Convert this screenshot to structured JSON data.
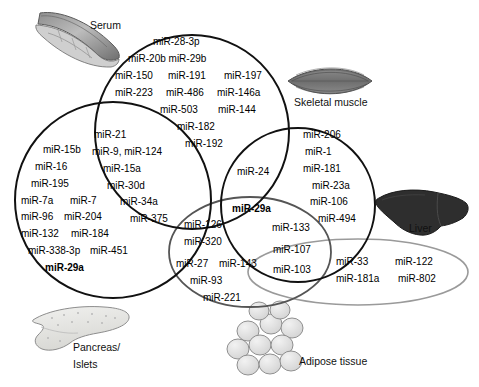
{
  "figure": {
    "type": "venn-diagram",
    "background": "#ffffff"
  },
  "sets": {
    "serum": {
      "name": "Serum",
      "shape": "circle",
      "stroke": "#111111",
      "cx": 192,
      "cy": 132,
      "r": 97
    },
    "pancreas": {
      "name": "Pancreas/ Islets",
      "shape": "circle",
      "stroke": "#111111",
      "cx": 113,
      "cy": 200,
      "r": 98
    },
    "skeletal_muscle": {
      "name": "Skeletal muscle",
      "shape": "circle",
      "stroke": "#111111",
      "cx": 298,
      "cy": 205,
      "r": 77
    },
    "adipose": {
      "name": "Adipose tissue",
      "shape": "ellipse",
      "stroke": "#555555",
      "cx": 250,
      "cy": 252,
      "rx": 81,
      "ry": 55
    },
    "liver": {
      "name": "Liver",
      "shape": "ellipse",
      "stroke": "#9a9a9a",
      "cx": 358,
      "cy": 272,
      "rx": 110,
      "ry": 33
    }
  },
  "tissue_labels": {
    "serum": "Serum",
    "skeletal_muscle": "Skeletal muscle",
    "liver": "Liver",
    "pancreas_line1": "Pancreas/",
    "pancreas_line2": "Islets",
    "adipose": "Adipose tissue"
  },
  "icons": {
    "serum": "blood-vessel-icon",
    "skeletal_muscle": "muscle-fiber-icon",
    "liver": "liver-organ-icon",
    "pancreas": "pancreas-organ-icon",
    "adipose": "adipocyte-cluster-icon"
  },
  "regions": {
    "serum_only": {
      "label": "Serum only",
      "entries": [
        "miR-28-3p",
        "miR-20b miR-29b",
        "miR-150   miR-191    miR-197",
        "miR-223  miR-486  miR-146a",
        "miR-503     miR-144",
        "miR-182",
        "miR-192"
      ]
    },
    "serum_pancreas": {
      "label": "Serum ∩ Pancreas/Islets",
      "entries": [
        "miR-21",
        "miR-9, miR-124",
        "miR-15a",
        "miR-30d",
        "miR-34a",
        "miR-375"
      ]
    },
    "pancreas_only": {
      "label": "Pancreas/Islets only",
      "entries": [
        "miR-15b",
        "miR-16",
        "miR-195",
        "miR-7a    miR-7",
        "miR-96  miR-204",
        "miR-132   miR-184",
        "miR-338-3p  miR-451",
        "miR-29a"
      ],
      "bold_entries": [
        "miR-29a"
      ]
    },
    "serum_skeletal": {
      "label": "Serum ∩ Skeletal muscle",
      "entries": [
        "miR-24"
      ]
    },
    "skeletal_only": {
      "label": "Skeletal muscle only",
      "entries": [
        "miR-206",
        "miR-1",
        "miR-181",
        "miR-23a",
        "miR-106",
        "miR-494"
      ]
    },
    "core_shared": {
      "label": "Serum ∩ Skeletal muscle ∩ Adipose",
      "entries": [
        "miR-29a"
      ],
      "bold_entries": [
        "miR-29a"
      ]
    },
    "serum_adipose": {
      "label": "Serum ∩ Adipose",
      "entries": [
        "miR-126",
        "miR-320"
      ]
    },
    "skeletal_adipose": {
      "label": "Skeletal muscle ∩ Adipose",
      "entries": [
        "miR-133"
      ]
    },
    "adipose_only": {
      "label": "Adipose tissue only",
      "entries": [
        "miR-27 miR-143",
        "miR-93",
        "miR-221"
      ]
    },
    "skeletal_adipose_liver": {
      "label": "Skeletal muscle ∩ Adipose ∩ Liver",
      "entries": [
        "miR-107"
      ]
    },
    "adipose_liver": {
      "label": "Adipose ∩ Liver",
      "entries": [
        "miR-103"
      ]
    },
    "liver_only": {
      "label": "Liver only",
      "entries": [
        "miR-33       miR-122",
        "miR-181a   miR-802"
      ]
    }
  },
  "text_items": [
    {
      "key": "t01",
      "text": "miR-28-3p",
      "x": 153,
      "y": 45,
      "bold": false,
      "region": "serum_only"
    },
    {
      "key": "t02",
      "text": "miR-20b miR-29b",
      "x": 128,
      "y": 62,
      "bold": false,
      "region": "serum_only"
    },
    {
      "key": "t03",
      "text": "miR-150",
      "x": 115,
      "y": 79,
      "bold": false,
      "region": "serum_only"
    },
    {
      "key": "t04",
      "text": "miR-191",
      "x": 168,
      "y": 79,
      "bold": false,
      "region": "serum_only"
    },
    {
      "key": "t05",
      "text": "miR-197",
      "x": 224,
      "y": 79,
      "bold": false,
      "region": "serum_only"
    },
    {
      "key": "t06",
      "text": "miR-223",
      "x": 115,
      "y": 96,
      "bold": false,
      "region": "serum_only"
    },
    {
      "key": "t07",
      "text": "miR-486",
      "x": 166,
      "y": 96,
      "bold": false,
      "region": "serum_only"
    },
    {
      "key": "t08",
      "text": "miR-146a",
      "x": 217,
      "y": 96,
      "bold": false,
      "region": "serum_only"
    },
    {
      "key": "t09",
      "text": "miR-503",
      "x": 160,
      "y": 113,
      "bold": false,
      "region": "serum_only"
    },
    {
      "key": "t10",
      "text": "miR-144",
      "x": 218,
      "y": 113,
      "bold": false,
      "region": "serum_only"
    },
    {
      "key": "t11",
      "text": "miR-182",
      "x": 177,
      "y": 130,
      "bold": false,
      "region": "serum_only"
    },
    {
      "key": "t12",
      "text": "miR-192",
      "x": 185,
      "y": 147,
      "bold": false,
      "region": "serum_only"
    },
    {
      "key": "t13",
      "text": "miR-21",
      "x": 94,
      "y": 138,
      "bold": false,
      "region": "serum_pancreas"
    },
    {
      "key": "t14",
      "text": "miR-9, miR-124",
      "x": 92,
      "y": 155,
      "bold": false,
      "region": "serum_pancreas"
    },
    {
      "key": "t15",
      "text": "miR-15a",
      "x": 103,
      "y": 172,
      "bold": false,
      "region": "serum_pancreas"
    },
    {
      "key": "t16",
      "text": "miR-30d",
      "x": 107,
      "y": 189,
      "bold": false,
      "region": "serum_pancreas"
    },
    {
      "key": "t17",
      "text": "miR-34a",
      "x": 120,
      "y": 205,
      "bold": false,
      "region": "serum_pancreas"
    },
    {
      "key": "t18",
      "text": "miR-375",
      "x": 130,
      "y": 222,
      "bold": false,
      "region": "serum_pancreas"
    },
    {
      "key": "t19",
      "text": "miR-15b",
      "x": 43,
      "y": 153,
      "bold": false,
      "region": "pancreas_only"
    },
    {
      "key": "t20",
      "text": "miR-16",
      "x": 35,
      "y": 170,
      "bold": false,
      "region": "pancreas_only"
    },
    {
      "key": "t21",
      "text": "miR-195",
      "x": 31,
      "y": 187,
      "bold": false,
      "region": "pancreas_only"
    },
    {
      "key": "t22",
      "text": "miR-7a",
      "x": 21,
      "y": 204,
      "bold": false,
      "region": "pancreas_only"
    },
    {
      "key": "t23",
      "text": "miR-7",
      "x": 70,
      "y": 204,
      "bold": false,
      "region": "pancreas_only"
    },
    {
      "key": "t24",
      "text": "miR-96",
      "x": 21,
      "y": 220,
      "bold": false,
      "region": "pancreas_only"
    },
    {
      "key": "t25",
      "text": "miR-204",
      "x": 64,
      "y": 220,
      "bold": false,
      "region": "pancreas_only"
    },
    {
      "key": "t26",
      "text": "miR-132",
      "x": 21,
      "y": 237,
      "bold": false,
      "region": "pancreas_only"
    },
    {
      "key": "t27",
      "text": "miR-184",
      "x": 71,
      "y": 237,
      "bold": false,
      "region": "pancreas_only"
    },
    {
      "key": "t28",
      "text": "miR-338-3p",
      "x": 28,
      "y": 254,
      "bold": false,
      "region": "pancreas_only"
    },
    {
      "key": "t29",
      "text": "miR-451",
      "x": 90,
      "y": 254,
      "bold": false,
      "region": "pancreas_only"
    },
    {
      "key": "t30",
      "text": "miR-29a",
      "x": 45,
      "y": 271,
      "bold": true,
      "region": "pancreas_only"
    },
    {
      "key": "t31",
      "text": "miR-24",
      "x": 237,
      "y": 175,
      "bold": false,
      "region": "serum_skeletal"
    },
    {
      "key": "t32",
      "text": "miR-206",
      "x": 303,
      "y": 138,
      "bold": false,
      "region": "skeletal_only"
    },
    {
      "key": "t33",
      "text": "miR-1",
      "x": 305,
      "y": 155,
      "bold": false,
      "region": "skeletal_only"
    },
    {
      "key": "t34",
      "text": "miR-181",
      "x": 303,
      "y": 172,
      "bold": false,
      "region": "skeletal_only"
    },
    {
      "key": "t35",
      "text": "miR-23a",
      "x": 312,
      "y": 189,
      "bold": false,
      "region": "skeletal_only"
    },
    {
      "key": "t36",
      "text": "miR-106",
      "x": 310,
      "y": 205,
      "bold": false,
      "region": "skeletal_only"
    },
    {
      "key": "t37",
      "text": "miR-494",
      "x": 318,
      "y": 222,
      "bold": false,
      "region": "skeletal_only"
    },
    {
      "key": "t38",
      "text": "miR-29a",
      "x": 232,
      "y": 212,
      "bold": true,
      "region": "core_shared"
    },
    {
      "key": "t39",
      "text": "miR-126",
      "x": 184,
      "y": 228,
      "bold": false,
      "region": "serum_adipose"
    },
    {
      "key": "t40",
      "text": "miR-320",
      "x": 184,
      "y": 245,
      "bold": false,
      "region": "serum_adipose"
    },
    {
      "key": "t41",
      "text": "miR-133",
      "x": 272,
      "y": 231,
      "bold": false,
      "region": "skeletal_adipose"
    },
    {
      "key": "t42",
      "text": "miR-107",
      "x": 273,
      "y": 253,
      "bold": false,
      "region": "skeletal_adipose_liver"
    },
    {
      "key": "t43",
      "text": "miR-103",
      "x": 273,
      "y": 273,
      "bold": false,
      "region": "adipose_liver"
    },
    {
      "key": "t44",
      "text": "miR-27",
      "x": 176,
      "y": 267,
      "bold": false,
      "region": "adipose_only"
    },
    {
      "key": "t45",
      "text": "miR-143",
      "x": 219,
      "y": 267,
      "bold": false,
      "region": "adipose_only"
    },
    {
      "key": "t46",
      "text": "miR-93",
      "x": 190,
      "y": 284,
      "bold": false,
      "region": "adipose_only"
    },
    {
      "key": "t47",
      "text": "miR-221",
      "x": 203,
      "y": 301,
      "bold": false,
      "region": "adipose_only"
    },
    {
      "key": "t48",
      "text": "miR-33",
      "x": 336,
      "y": 265,
      "bold": false,
      "region": "liver_only"
    },
    {
      "key": "t49",
      "text": "miR-122",
      "x": 395,
      "y": 265,
      "bold": false,
      "region": "liver_only"
    },
    {
      "key": "t50",
      "text": "miR-181a",
      "x": 336,
      "y": 282,
      "bold": false,
      "region": "liver_only"
    },
    {
      "key": "t51",
      "text": "miR-802",
      "x": 398,
      "y": 282,
      "bold": false,
      "region": "liver_only"
    }
  ],
  "tissue_label_positions": [
    {
      "key": "serum",
      "text": "Serum",
      "x": 90,
      "y": 26
    },
    {
      "key": "skeletal-muscle",
      "text": "Skeletal muscle",
      "x": 294,
      "y": 103
    },
    {
      "key": "liver",
      "text": "Liver",
      "x": 420,
      "y": 228
    },
    {
      "key": "adipose",
      "text": "Adipose tissue",
      "x": 299,
      "y": 362
    }
  ],
  "colors": {
    "serum_stroke": "#111111",
    "pancreas_stroke": "#111111",
    "skeletal_stroke": "#111111",
    "adipose_stroke": "#555555",
    "liver_stroke": "#9a9a9a",
    "text": "#000000"
  }
}
